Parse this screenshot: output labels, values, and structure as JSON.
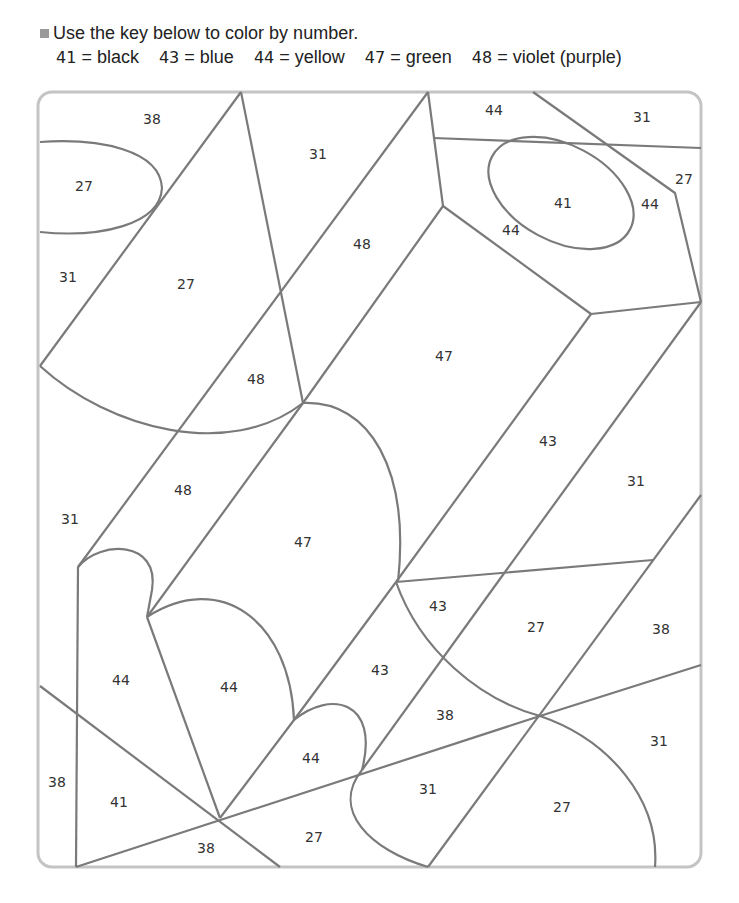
{
  "instructions": {
    "heading": "Use the key below to color by number.",
    "key": [
      {
        "number": "41",
        "equals": "=",
        "color": "black"
      },
      {
        "number": "43",
        "equals": "=",
        "color": "blue"
      },
      {
        "number": "44",
        "equals": "=",
        "color": "yellow"
      },
      {
        "number": "47",
        "equals": "=",
        "color": "green"
      },
      {
        "number": "48",
        "equals": "=",
        "color": "violet (purple)"
      }
    ]
  },
  "colors": {
    "line": "#7a7a7a",
    "frame": "#c4c4c4",
    "bullet": "#9a9a9a"
  },
  "regions": [
    {
      "label": "38",
      "x": 152,
      "y": 120
    },
    {
      "label": "27",
      "x": 84,
      "y": 187
    },
    {
      "label": "31",
      "x": 68,
      "y": 278
    },
    {
      "label": "27",
      "x": 186,
      "y": 285
    },
    {
      "label": "31",
      "x": 318,
      "y": 155
    },
    {
      "label": "48",
      "x": 362,
      "y": 245
    },
    {
      "label": "48",
      "x": 256,
      "y": 380
    },
    {
      "label": "44",
      "x": 494,
      "y": 111
    },
    {
      "label": "31",
      "x": 642,
      "y": 118
    },
    {
      "label": "27",
      "x": 684,
      "y": 180
    },
    {
      "label": "41",
      "x": 563,
      "y": 204
    },
    {
      "label": "44",
      "x": 650,
      "y": 205
    },
    {
      "label": "44",
      "x": 511,
      "y": 231
    },
    {
      "label": "47",
      "x": 444,
      "y": 357
    },
    {
      "label": "43",
      "x": 548,
      "y": 442
    },
    {
      "label": "31",
      "x": 636,
      "y": 482
    },
    {
      "label": "48",
      "x": 183,
      "y": 491
    },
    {
      "label": "31",
      "x": 70,
      "y": 520
    },
    {
      "label": "47",
      "x": 303,
      "y": 543
    },
    {
      "label": "43",
      "x": 438,
      "y": 607
    },
    {
      "label": "27",
      "x": 536,
      "y": 628
    },
    {
      "label": "38",
      "x": 661,
      "y": 630
    },
    {
      "label": "44",
      "x": 121,
      "y": 681
    },
    {
      "label": "44",
      "x": 229,
      "y": 688
    },
    {
      "label": "43",
      "x": 380,
      "y": 671
    },
    {
      "label": "38",
      "x": 445,
      "y": 716
    },
    {
      "label": "31",
      "x": 659,
      "y": 742
    },
    {
      "label": "44",
      "x": 311,
      "y": 759
    },
    {
      "label": "38",
      "x": 57,
      "y": 783
    },
    {
      "label": "41",
      "x": 119,
      "y": 803
    },
    {
      "label": "31",
      "x": 428,
      "y": 790
    },
    {
      "label": "27",
      "x": 562,
      "y": 808
    },
    {
      "label": "27",
      "x": 314,
      "y": 838
    },
    {
      "label": "38",
      "x": 206,
      "y": 849
    }
  ]
}
